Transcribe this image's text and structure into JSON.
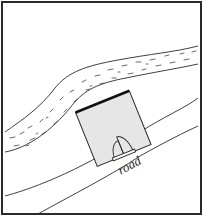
{
  "diagram": {
    "type": "site-sketch",
    "labels": {
      "road": "road"
    },
    "features": [
      {
        "name": "river",
        "style": "dashed-texture band"
      },
      {
        "name": "building",
        "style": "shaded square with double door"
      },
      {
        "name": "road",
        "style": "diagonal band"
      }
    ],
    "colors": {
      "stroke": "#2a2a2a",
      "building_fill": "#e6e6e6",
      "background": "#ffffff"
    }
  }
}
